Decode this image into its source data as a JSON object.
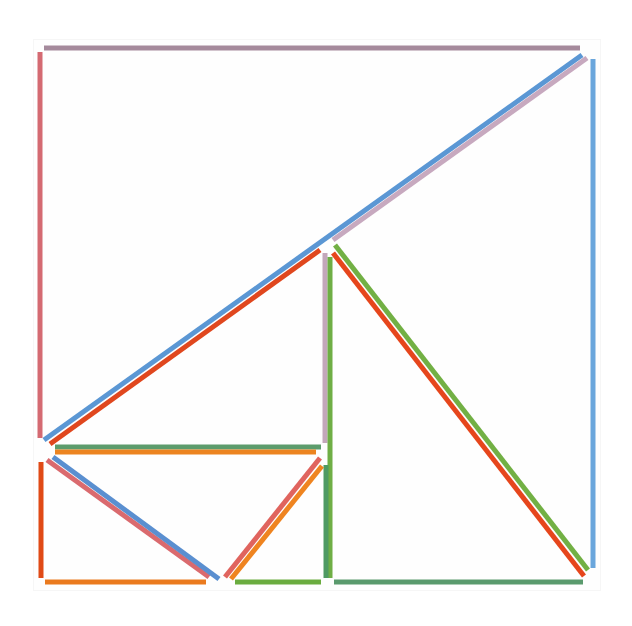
{
  "artwork": {
    "background": "#ffffff",
    "stroke_width": 5,
    "segments": [
      {
        "name": "top-edge",
        "x1": 44,
        "y1": 48,
        "x2": 580,
        "y2": 48,
        "color": "#a58a9c"
      },
      {
        "name": "left-edge-upper",
        "x1": 40,
        "y1": 52,
        "x2": 40,
        "y2": 438,
        "color": "#d46a72"
      },
      {
        "name": "right-edge",
        "x1": 593,
        "y1": 59,
        "x2": 593,
        "y2": 568,
        "color": "#6aa6dc"
      },
      {
        "name": "big-diagonal-blue",
        "x1": 44,
        "y1": 440,
        "x2": 582,
        "y2": 55,
        "color": "#5b97d4"
      },
      {
        "name": "big-diagonal-mauve",
        "x1": 333,
        "y1": 240,
        "x2": 587,
        "y2": 58,
        "color": "#c7a9bf"
      },
      {
        "name": "big-diagonal-red",
        "x1": 50,
        "y1": 444,
        "x2": 320,
        "y2": 250,
        "color": "#e0471e"
      },
      {
        "name": "inner-vertical-mauve",
        "x1": 325,
        "y1": 253,
        "x2": 325,
        "y2": 443,
        "color": "#c3a7ba"
      },
      {
        "name": "inner-vertical-green",
        "x1": 330,
        "y1": 257,
        "x2": 330,
        "y2": 578,
        "color": "#6fae45"
      },
      {
        "name": "inner-vertical-green-lower",
        "x1": 326,
        "y1": 465,
        "x2": 326,
        "y2": 578,
        "color": "#4f9a63"
      },
      {
        "name": "right-triangle-green",
        "x1": 335,
        "y1": 245,
        "x2": 588,
        "y2": 570,
        "color": "#72b044"
      },
      {
        "name": "right-triangle-red",
        "x1": 333,
        "y1": 253,
        "x2": 584,
        "y2": 576,
        "color": "#e6461c"
      },
      {
        "name": "bottom-edge-right",
        "x1": 334,
        "y1": 582,
        "x2": 583,
        "y2": 582,
        "color": "#5a9a6d"
      },
      {
        "name": "middle-horizontal-green",
        "x1": 55,
        "y1": 447,
        "x2": 321,
        "y2": 447,
        "color": "#5c9c6c"
      },
      {
        "name": "middle-horizontal-orange",
        "x1": 55,
        "y1": 452,
        "x2": 316,
        "y2": 452,
        "color": "#ec8420"
      },
      {
        "name": "left-edge-lower",
        "x1": 41,
        "y1": 462,
        "x2": 41,
        "y2": 578,
        "color": "#e04a16"
      },
      {
        "name": "bottom-edge-left",
        "x1": 45,
        "y1": 582,
        "x2": 206,
        "y2": 582,
        "color": "#ea7a1e"
      },
      {
        "name": "bottom-edge-middle",
        "x1": 235,
        "y1": 582,
        "x2": 321,
        "y2": 582,
        "color": "#6aac3f"
      },
      {
        "name": "left-v-diagonal-pink",
        "x1": 47,
        "y1": 460,
        "x2": 209,
        "y2": 577,
        "color": "#da6a6e"
      },
      {
        "name": "left-v-diagonal-blue",
        "x1": 53,
        "y1": 457,
        "x2": 219,
        "y2": 579,
        "color": "#5a8fd0"
      },
      {
        "name": "right-v-diagonal-pink",
        "x1": 225,
        "y1": 577,
        "x2": 320,
        "y2": 458,
        "color": "#e0645e"
      },
      {
        "name": "right-v-diagonal-orange",
        "x1": 231,
        "y1": 579,
        "x2": 322,
        "y2": 466,
        "color": "#ef8420"
      }
    ]
  }
}
